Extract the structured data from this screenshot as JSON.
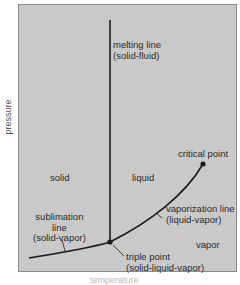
{
  "diagram": {
    "type": "phase diagram",
    "axes": {
      "y_label": "pressure",
      "x_label": "temperature"
    },
    "regions": {
      "solid": "solid",
      "liquid": "liquid",
      "vapor": "vapor"
    },
    "lines": {
      "melting": {
        "line1": "melting line",
        "line2": "(solid-fluid)"
      },
      "sublimation": {
        "line1": "sublimation",
        "line2": "line",
        "line3": "(solid-vapor)"
      },
      "vaporization": {
        "line1": "vaporization line",
        "line2": "(liquid-vapor)"
      }
    },
    "points": {
      "critical": "critical point",
      "triple": {
        "line1": "triple point",
        "line2": "(solid-liquid-vapor)"
      }
    },
    "colors": {
      "background": "#c9c9c9",
      "line": "#1a1a1a",
      "text": "#2a2a2a"
    }
  }
}
